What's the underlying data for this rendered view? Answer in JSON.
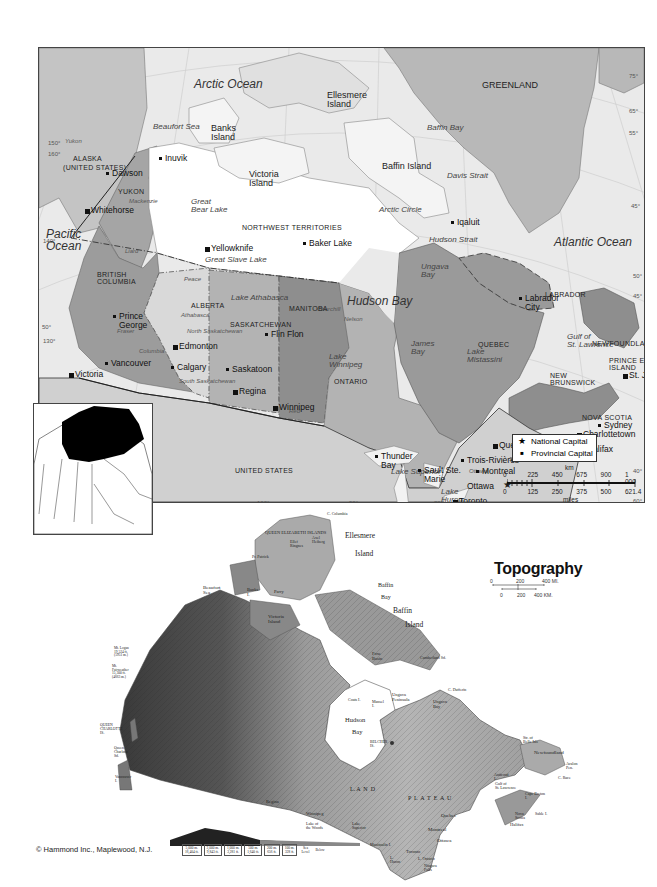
{
  "political_map": {
    "oceans": [
      {
        "label": "Arctic Ocean",
        "x": 155,
        "y": 30
      },
      {
        "label": "Pacific\nOcean",
        "x": 7,
        "y": 180
      },
      {
        "label": "Atlantic Ocean",
        "x": 515,
        "y": 188
      },
      {
        "label": "Hudson Bay",
        "x": 308,
        "y": 247
      }
    ],
    "water_bodies": [
      {
        "label": "Beaufort Sea",
        "x": 114,
        "y": 75
      },
      {
        "label": "Baffin Bay",
        "x": 388,
        "y": 76
      },
      {
        "label": "Davis Strait",
        "x": 408,
        "y": 124
      },
      {
        "label": "Hudson Strait",
        "x": 390,
        "y": 188
      },
      {
        "label": "Ungava\nBay",
        "x": 382,
        "y": 215
      },
      {
        "label": "James\nBay",
        "x": 372,
        "y": 292
      },
      {
        "label": "Lake\nMistassini",
        "x": 428,
        "y": 300
      },
      {
        "label": "Gulf of\nSt. Lawrence",
        "x": 528,
        "y": 285
      },
      {
        "label": "Bay of\nFundy",
        "x": 518,
        "y": 390
      },
      {
        "label": "Great\nBear Lake",
        "x": 152,
        "y": 150
      },
      {
        "label": "Great Slave Lake",
        "x": 166,
        "y": 208
      },
      {
        "label": "Lake Athabasca",
        "x": 192,
        "y": 246
      },
      {
        "label": "Lake\nWinnipeg",
        "x": 290,
        "y": 305
      },
      {
        "label": "Lake Superior",
        "x": 352,
        "y": 420
      },
      {
        "label": "Lake\nHuron",
        "x": 402,
        "y": 440
      },
      {
        "label": "Lake Michigan",
        "x": 366,
        "y": 460
      },
      {
        "label": "Lake Ontario",
        "x": 434,
        "y": 455
      },
      {
        "label": "Lake Erie",
        "x": 408,
        "y": 476
      }
    ],
    "rivers": [
      {
        "label": "Yukon",
        "x": 26,
        "y": 90
      },
      {
        "label": "Mackenzie",
        "x": 90,
        "y": 150
      },
      {
        "label": "Liard",
        "x": 86,
        "y": 200
      },
      {
        "label": "Peace",
        "x": 145,
        "y": 228
      },
      {
        "label": "Athabasca",
        "x": 142,
        "y": 264
      },
      {
        "label": "North Saskatchewan",
        "x": 148,
        "y": 280
      },
      {
        "label": "South Saskatchewan",
        "x": 140,
        "y": 330
      },
      {
        "label": "Fraser",
        "x": 78,
        "y": 280
      },
      {
        "label": "Columbia",
        "x": 100,
        "y": 300
      },
      {
        "label": "Churchill",
        "x": 278,
        "y": 258
      },
      {
        "label": "Nelson",
        "x": 305,
        "y": 268
      },
      {
        "label": "Red",
        "x": 250,
        "y": 360
      },
      {
        "label": "Ottawa",
        "x": 430,
        "y": 420
      },
      {
        "label": "St. Lawrence",
        "x": 470,
        "y": 408
      }
    ],
    "islands": [
      {
        "label": "Ellesmere\nIsland",
        "x": 288,
        "y": 43
      },
      {
        "label": "Banks\nIsland",
        "x": 172,
        "y": 76
      },
      {
        "label": "Victoria\nIsland",
        "x": 210,
        "y": 122
      },
      {
        "label": "Baffin Island",
        "x": 343,
        "y": 114
      },
      {
        "label": "GREENLAND",
        "x": 443,
        "y": 33
      }
    ],
    "regions": [
      {
        "label": "ALASKA",
        "x": 34,
        "y": 107
      },
      {
        "label": "(UNITED STATES)",
        "x": 24,
        "y": 116
      },
      {
        "label": "YUKON",
        "x": 79,
        "y": 140
      },
      {
        "label": "NORTHWEST TERRITORIES",
        "x": 203,
        "y": 176
      },
      {
        "label": "BRITISH\nCOLUMBIA",
        "x": 58,
        "y": 223
      },
      {
        "label": "ALBERTA",
        "x": 152,
        "y": 254
      },
      {
        "label": "SASKATCHEWAN",
        "x": 191,
        "y": 273
      },
      {
        "label": "MANITOBA",
        "x": 250,
        "y": 257
      },
      {
        "label": "ONTARIO",
        "x": 295,
        "y": 330
      },
      {
        "label": "QUEBEC",
        "x": 439,
        "y": 293
      },
      {
        "label": "LABRADOR",
        "x": 506,
        "y": 243
      },
      {
        "label": "NEWFOUNDLAND",
        "x": 553,
        "y": 292
      },
      {
        "label": "PRINCE EDWARD\nISLAND",
        "x": 570,
        "y": 309
      },
      {
        "label": "NEW\nBRUNSWICK",
        "x": 511,
        "y": 324
      },
      {
        "label": "NOVA SCOTIA",
        "x": 543,
        "y": 366
      },
      {
        "label": "UNITED STATES",
        "x": 196,
        "y": 419
      }
    ],
    "other_labels": [
      {
        "label": "Arctic Circle",
        "x": 340,
        "y": 158
      }
    ],
    "cities": [
      {
        "label": "Dawson",
        "x": 73,
        "y": 121,
        "type": "city"
      },
      {
        "label": "Inuvik",
        "x": 126,
        "y": 106,
        "type": "city"
      },
      {
        "label": "Whitehorse",
        "x": 52,
        "y": 158,
        "type": "provincial_capital"
      },
      {
        "label": "Yellowknife",
        "x": 172,
        "y": 196,
        "type": "provincial_capital"
      },
      {
        "label": "Baker Lake",
        "x": 270,
        "y": 191,
        "type": "city"
      },
      {
        "label": "Iqaluit",
        "x": 418,
        "y": 170,
        "type": "city"
      },
      {
        "label": "Prince\nGeorge",
        "x": 80,
        "y": 264,
        "type": "city"
      },
      {
        "label": "Edmonton",
        "x": 140,
        "y": 294,
        "type": "provincial_capital"
      },
      {
        "label": "Calgary",
        "x": 138,
        "y": 315,
        "type": "city"
      },
      {
        "label": "Vancouver",
        "x": 72,
        "y": 311,
        "type": "city"
      },
      {
        "label": "Victoria",
        "x": 36,
        "y": 322,
        "type": "provincial_capital"
      },
      {
        "label": "Saskatoon",
        "x": 193,
        "y": 317,
        "type": "city"
      },
      {
        "label": "Regina",
        "x": 200,
        "y": 339,
        "type": "provincial_capital"
      },
      {
        "label": "Flin Flon",
        "x": 232,
        "y": 282,
        "type": "city"
      },
      {
        "label": "Winnipeg",
        "x": 240,
        "y": 355,
        "type": "provincial_capital"
      },
      {
        "label": "Thunder\nBay",
        "x": 342,
        "y": 404,
        "type": "city"
      },
      {
        "label": "Sault Ste.\nMarie",
        "x": 385,
        "y": 418,
        "type": "city"
      },
      {
        "label": "Toronto",
        "x": 420,
        "y": 449,
        "type": "provincial_capital"
      },
      {
        "label": "Ottawa",
        "x": 428,
        "y": 434,
        "type": "national_capital"
      },
      {
        "label": "Montreal",
        "x": 443,
        "y": 419,
        "type": "city"
      },
      {
        "label": "Trois-Rivières",
        "x": 428,
        "y": 408,
        "type": "city"
      },
      {
        "label": "Quebec",
        "x": 460,
        "y": 393,
        "type": "provincial_capital"
      },
      {
        "label": "Labrador\nCity",
        "x": 486,
        "y": 246,
        "type": "city"
      },
      {
        "label": "Moncton",
        "x": 509,
        "y": 385,
        "type": "city"
      },
      {
        "label": "Fredericton",
        "x": 515,
        "y": 400,
        "type": "provincial_capital"
      },
      {
        "label": "Charlottetown",
        "x": 544,
        "y": 382,
        "type": "provincial_capital"
      },
      {
        "label": "Halifax",
        "x": 548,
        "y": 397,
        "type": "provincial_capital"
      },
      {
        "label": "Sydney",
        "x": 565,
        "y": 373,
        "type": "city"
      },
      {
        "label": "St. John's",
        "x": 590,
        "y": 323,
        "type": "provincial_capital"
      }
    ],
    "degree_labels": [
      {
        "label": "150°",
        "x": 9,
        "y": 92
      },
      {
        "label": "160°",
        "x": 9,
        "y": 103
      },
      {
        "label": "140°",
        "x": 4,
        "y": 190
      },
      {
        "label": "50°",
        "x": 3,
        "y": 276
      },
      {
        "label": "130°",
        "x": 4,
        "y": 290
      },
      {
        "label": "100°",
        "x": 218,
        "y": 452
      },
      {
        "label": "90°",
        "x": 310,
        "y": 452
      },
      {
        "label": "80°",
        "x": 395,
        "y": 452
      },
      {
        "label": "75°",
        "x": 590,
        "y": 25
      },
      {
        "label": "65°",
        "x": 590,
        "y": 60
      },
      {
        "label": "55°",
        "x": 590,
        "y": 82
      },
      {
        "label": "45°",
        "x": 592,
        "y": 155
      },
      {
        "label": "50°",
        "x": 594,
        "y": 225
      },
      {
        "label": "45°",
        "x": 594,
        "y": 245
      },
      {
        "label": "40°",
        "x": 594,
        "y": 420
      },
      {
        "label": "60°",
        "x": 594,
        "y": 450
      }
    ],
    "legend": {
      "items": [
        {
          "symbol": "★",
          "label": "National Capital"
        },
        {
          "symbol": "■",
          "label": "Provincial Capital"
        }
      ]
    },
    "scale_bar": {
      "unit_top": "km",
      "ticks_top": [
        "0",
        "225",
        "450",
        "675",
        "900",
        "1 000"
      ],
      "ticks_bottom": [
        "0",
        "125",
        "250",
        "375",
        "500",
        "621.4"
      ],
      "unit_bottom": "miles"
    }
  },
  "topography_map": {
    "title": "Topography",
    "scale": {
      "top_ticks": [
        "0",
        "200",
        "400 MI."
      ],
      "bottom_ticks": [
        "0",
        "200",
        "400 KM."
      ]
    },
    "labels": [
      {
        "label": "C. Columbia",
        "x": 327,
        "y": 512,
        "size": 4
      },
      {
        "label": "QUEEN ELIZABETH ISLANDS",
        "x": 265,
        "y": 531,
        "size": 4.5
      },
      {
        "label": "Ellesmere",
        "x": 345,
        "y": 532,
        "size": 7.5
      },
      {
        "label": "Island",
        "x": 355,
        "y": 550,
        "size": 7.5
      },
      {
        "label": "Ellef\nRingnes",
        "x": 290,
        "y": 540,
        "size": 4
      },
      {
        "label": "Axel\nHeiberg",
        "x": 312,
        "y": 536,
        "size": 4
      },
      {
        "label": "Pr. Patrick",
        "x": 252,
        "y": 555,
        "size": 4
      },
      {
        "label": "Baffin",
        "x": 378,
        "y": 582,
        "size": 6
      },
      {
        "label": "Bay",
        "x": 381,
        "y": 594,
        "size": 6
      },
      {
        "label": "Baffin",
        "x": 393,
        "y": 607,
        "size": 7.5
      },
      {
        "label": "Island",
        "x": 405,
        "y": 621,
        "size": 7.5
      },
      {
        "label": "Beaufort\nSea",
        "x": 203,
        "y": 585,
        "size": 5
      },
      {
        "label": "Banks\nI.",
        "x": 247,
        "y": 588,
        "size": 4.5
      },
      {
        "label": "Parry",
        "x": 274,
        "y": 590,
        "size": 4.5
      },
      {
        "label": "Victoria\nIsland",
        "x": 268,
        "y": 614,
        "size": 5
      },
      {
        "label": "Foxe\nBasin",
        "x": 372,
        "y": 652,
        "size": 4.5
      },
      {
        "label": "Cumberland Sd.",
        "x": 420,
        "y": 656,
        "size": 4
      },
      {
        "label": "C. Dufferin",
        "x": 448,
        "y": 688,
        "size": 4
      },
      {
        "label": "Ungava\nPeninsula",
        "x": 392,
        "y": 693,
        "size": 4.5
      },
      {
        "label": "Ungava\nBay",
        "x": 433,
        "y": 700,
        "size": 4.5
      },
      {
        "label": "Coats I.",
        "x": 348,
        "y": 698,
        "size": 4
      },
      {
        "label": "Mansel\nI.",
        "x": 372,
        "y": 700,
        "size": 4
      },
      {
        "label": "Hudson",
        "x": 345,
        "y": 717,
        "size": 6.5
      },
      {
        "label": "Bay",
        "x": 352,
        "y": 729,
        "size": 6.5
      },
      {
        "label": "BELCHER\nIS.",
        "x": 370,
        "y": 741,
        "size": 3.8
      },
      {
        "label": "Str. of\nBelle Isle",
        "x": 523,
        "y": 736,
        "size": 4
      },
      {
        "label": "Newfoundland",
        "x": 534,
        "y": 750,
        "size": 5
      },
      {
        "label": "Avalon\nPen.",
        "x": 566,
        "y": 762,
        "size": 4
      },
      {
        "label": "C. Race",
        "x": 558,
        "y": 776,
        "size": 4
      },
      {
        "label": "Anticosti\nI.",
        "x": 494,
        "y": 773,
        "size": 4
      },
      {
        "label": "Gulf of\nSt. Lawrence",
        "x": 495,
        "y": 782,
        "size": 4
      },
      {
        "label": "Cape Breton\nI.",
        "x": 525,
        "y": 792,
        "size": 4
      },
      {
        "label": "Sable I.",
        "x": 535,
        "y": 812,
        "size": 4
      },
      {
        "label": "Nova\nScotia",
        "x": 515,
        "y": 812,
        "size": 4
      },
      {
        "label": "Halifax",
        "x": 510,
        "y": 823,
        "size": 4.5
      },
      {
        "label": "Quebec",
        "x": 441,
        "y": 813,
        "size": 5
      },
      {
        "label": "Montreal",
        "x": 428,
        "y": 827,
        "size": 5
      },
      {
        "label": "Ottawa",
        "x": 437,
        "y": 838,
        "size": 5
      },
      {
        "label": "Toronto",
        "x": 406,
        "y": 850,
        "size": 4.5
      },
      {
        "label": "L. Ontario",
        "x": 418,
        "y": 857,
        "size": 4
      },
      {
        "label": "Niagara\nFalls",
        "x": 424,
        "y": 864,
        "size": 4
      },
      {
        "label": "L.\nHuron",
        "x": 390,
        "y": 856,
        "size": 4
      },
      {
        "label": "Manitoulin I.",
        "x": 370,
        "y": 843,
        "size": 4
      },
      {
        "label": "Lake\nSuperior",
        "x": 352,
        "y": 822,
        "size": 4
      },
      {
        "label": "L. A  N  D",
        "x": 350,
        "y": 786,
        "size": 6
      },
      {
        "label": "P  L  A  T  E  A  U",
        "x": 408,
        "y": 795,
        "size": 6
      },
      {
        "label": "Winnipeg",
        "x": 306,
        "y": 812,
        "size": 4.5
      },
      {
        "label": "Regina",
        "x": 266,
        "y": 800,
        "size": 4.5
      },
      {
        "label": "Lake of\nthe Woods",
        "x": 306,
        "y": 822,
        "size": 4
      },
      {
        "label": "Mt. Logan\n19,524 ft.\n(5951 m.)",
        "x": 114,
        "y": 647,
        "size": 3.5
      },
      {
        "label": "Mt.\nFairweather\n15,300 ft.\n(4663 m.)",
        "x": 112,
        "y": 665,
        "size": 3.5
      },
      {
        "label": "QUEEN\nCHARLOTTE\nIS.",
        "x": 100,
        "y": 724,
        "size": 3.8
      },
      {
        "label": "Queen\nCharlotte\nSd.",
        "x": 114,
        "y": 747,
        "size": 3.8
      },
      {
        "label": "Vancouver\nI.",
        "x": 115,
        "y": 776,
        "size": 3.8
      }
    ],
    "elevation_legend": [
      {
        "top": "5,000 m.",
        "bottom": "16,404 ft."
      },
      {
        "top": "3,000 m.",
        "bottom": "9,843 ft."
      },
      {
        "top": "1,000 m.",
        "bottom": "3,281 ft."
      },
      {
        "top": "500 m.",
        "bottom": "1,640 ft."
      },
      {
        "top": "200 m.",
        "bottom": "656 ft."
      },
      {
        "top": "100 m.",
        "bottom": "328 ft."
      },
      {
        "top": "Sea",
        "bottom": "Level"
      },
      {
        "top": "Below",
        "bottom": ""
      }
    ],
    "credit": "© Hammond Inc., Maplewood, N.J."
  }
}
